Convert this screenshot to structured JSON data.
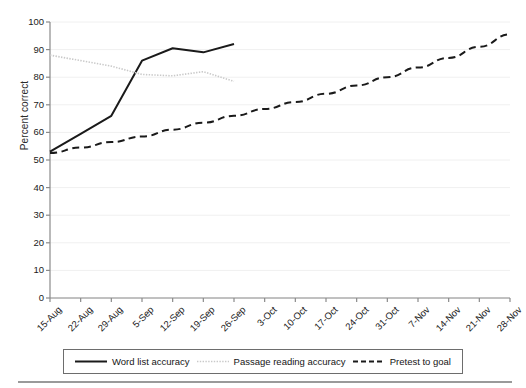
{
  "chart_data": {
    "type": "line",
    "title": "",
    "xlabel": "",
    "ylabel": "Percent correct",
    "ylim": [
      0,
      100
    ],
    "ytick_step": 10,
    "yticks": [
      100,
      90,
      80,
      70,
      60,
      50,
      40,
      30,
      20,
      10,
      0
    ],
    "grid": true,
    "grid_color": "#f0f0f0",
    "legend_position": "bottom",
    "categories": [
      "15-Aug",
      "22-Aug",
      "29-Aug",
      "5-Sep",
      "12-Sep",
      "19-Sep",
      "26-Sep",
      "3-Oct",
      "10-Oct",
      "17-Oct",
      "24-Oct",
      "31-Oct",
      "7-Nov",
      "14-Nov",
      "21-Nov",
      "28-Nov"
    ],
    "series": [
      {
        "name": "Word list accuracy",
        "style": "solid",
        "color": "#1a1a1a",
        "width": 2.0,
        "values": [
          53,
          59.5,
          66,
          86,
          90.5,
          89,
          92,
          null,
          null,
          null,
          null,
          null,
          null,
          null,
          null,
          null
        ]
      },
      {
        "name": "Passage reading accuracy",
        "style": "dotted",
        "color": "#c9c9c9",
        "width": 1.6,
        "values": [
          88,
          86,
          84,
          81,
          80.5,
          82,
          78.5,
          null,
          null,
          null,
          null,
          null,
          null,
          null,
          null,
          null
        ]
      },
      {
        "name": "Pretest to goal",
        "style": "dashed",
        "color": "#1a1a1a",
        "width": 2.0,
        "values": [
          52.5,
          54.5,
          56.5,
          58.5,
          61,
          63.5,
          66,
          68.5,
          71,
          74,
          77,
          80,
          83.5,
          87,
          91,
          95.5
        ]
      }
    ]
  },
  "legend": {
    "items": [
      {
        "label": "Word list accuracy",
        "swatch": "solid-line-swatch"
      },
      {
        "label": "Passage reading accuracy",
        "swatch": "dotted-line-swatch"
      },
      {
        "label": "Pretest to goal",
        "swatch": "dashed-line-swatch"
      }
    ]
  }
}
